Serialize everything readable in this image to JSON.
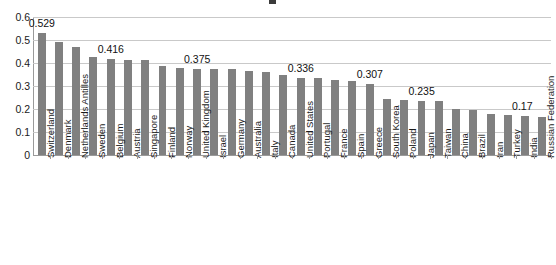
{
  "chart_data": {
    "type": "bar",
    "title": "",
    "xlabel": "",
    "ylabel": "",
    "ylim": [
      0,
      0.6
    ],
    "yticks": [
      "0",
      "0.1",
      "0.2",
      "0.3",
      "0.4",
      "0.5",
      "0.6"
    ],
    "grid": true,
    "legend": "none",
    "bar_color": "#808080",
    "gridline_color": "#c9c9c9",
    "axis_color": "#9a9a9a",
    "categories": [
      "Switzerland",
      "Denmark",
      "Netherlands Antilles",
      "Sweden",
      "Belgium",
      "Austria",
      "Singapore",
      "Finland",
      "Norway",
      "United Kingdom",
      "Israel",
      "Germany",
      "Australia",
      "Italy",
      "Canada",
      "United States",
      "Portugal",
      "France",
      "Spain",
      "Greece",
      "South Korea",
      "Poland",
      "Japan",
      "Taiwan",
      "China",
      "Brazil",
      "Iran",
      "Turkey",
      "India",
      "Russian Federation"
    ],
    "values": [
      0.529,
      0.49,
      0.471,
      0.427,
      0.416,
      0.415,
      0.415,
      0.385,
      0.379,
      0.375,
      0.375,
      0.372,
      0.366,
      0.361,
      0.348,
      0.336,
      0.333,
      0.325,
      0.32,
      0.307,
      0.243,
      0.238,
      0.235,
      0.235,
      0.199,
      0.197,
      0.178,
      0.175,
      0.17,
      0.165
    ],
    "data_labels": [
      {
        "index": 0,
        "text": "0.529"
      },
      {
        "index": 4,
        "text": "0.416"
      },
      {
        "index": 9,
        "text": "0.375"
      },
      {
        "index": 15,
        "text": "0.336"
      },
      {
        "index": 19,
        "text": "0.307"
      },
      {
        "index": 22,
        "text": "0.235"
      },
      {
        "index": 28,
        "text": "0.17"
      }
    ]
  }
}
